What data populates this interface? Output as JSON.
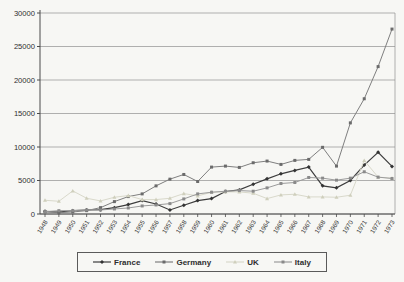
{
  "chart_data": {
    "type": "line",
    "title": "",
    "xlabel": "",
    "ylabel": "",
    "x": [
      1948,
      1949,
      1950,
      1951,
      1952,
      1953,
      1954,
      1955,
      1956,
      1957,
      1958,
      1959,
      1960,
      1961,
      1962,
      1963,
      1964,
      1965,
      1966,
      1967,
      1968,
      1969,
      1970,
      1971,
      1972,
      1973
    ],
    "ylim": [
      0,
      30000
    ],
    "ytick_step": 5000,
    "yticks": [
      0,
      5000,
      10000,
      15000,
      20000,
      25000,
      30000
    ],
    "grid": "horizontal",
    "legend_position": "bottom",
    "series": [
      {
        "name": "France",
        "color": "#3d3d3d",
        "marker": "diamond",
        "marker_color": "#333333",
        "values": [
          400,
          300,
          500,
          600,
          650,
          950,
          1400,
          2000,
          1500,
          600,
          1300,
          2000,
          2300,
          3350,
          3600,
          4450,
          5250,
          6000,
          6500,
          7000,
          4200,
          3900,
          5000,
          7300,
          9200,
          7100
        ]
      },
      {
        "name": "Germany",
        "color": "#7f7f7f",
        "marker": "square",
        "marker_color": "#6b6b6b",
        "values": [
          300,
          200,
          300,
          500,
          950,
          1850,
          2600,
          3000,
          4200,
          5200,
          5900,
          4850,
          7000,
          7150,
          6950,
          7650,
          7900,
          7400,
          8000,
          8150,
          9950,
          7150,
          13600,
          17200,
          22000,
          27600
        ]
      },
      {
        "name": "UK",
        "color": "#d9d9cb",
        "marker": "triangle",
        "marker_color": "#cfcfbc",
        "values": [
          2050,
          1900,
          3450,
          2350,
          1950,
          2500,
          2750,
          2150,
          2150,
          2350,
          3050,
          2700,
          3250,
          3300,
          3300,
          3100,
          2300,
          2850,
          2950,
          2550,
          2550,
          2500,
          2800,
          8000,
          5500,
          5350
        ]
      },
      {
        "name": "Italy",
        "color": "#9b9b9b",
        "marker": "square",
        "marker_color": "#8a8a8a",
        "values": [
          350,
          500,
          500,
          600,
          600,
          750,
          900,
          1200,
          1350,
          1550,
          2250,
          3000,
          3250,
          3400,
          3500,
          3400,
          3900,
          4550,
          4700,
          5450,
          5350,
          5050,
          5350,
          6300,
          5500,
          5300
        ]
      }
    ],
    "colors": {
      "background": "#f7f7f4",
      "gridline": "#8f8f8f",
      "axis": "#4a4a4a",
      "tick_text": "#2e2e2e"
    }
  }
}
